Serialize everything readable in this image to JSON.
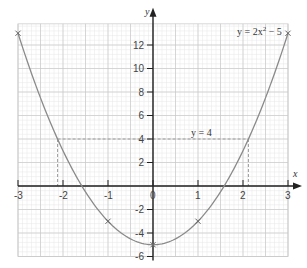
{
  "chart_data": {
    "type": "line",
    "title": "",
    "xlabel": "x",
    "ylabel": "y",
    "xlim": [
      -3,
      3
    ],
    "ylim": [
      -6,
      14
    ],
    "grid": true,
    "x_ticks": [
      -3,
      -2,
      -1,
      0,
      1,
      2,
      3
    ],
    "x_tick_labels": [
      "-3",
      "-2",
      "-1",
      "0",
      "1",
      "2",
      "3"
    ],
    "y_ticks": [
      -6,
      -4,
      -2,
      2,
      4,
      6,
      8,
      10,
      12
    ],
    "y_tick_labels": [
      "-6",
      "-4",
      "-2",
      "2",
      "4",
      "6",
      "8",
      "10",
      "12"
    ],
    "series": [
      {
        "name": "y = 2x² − 5",
        "equation": "y = 2x^2 - 5",
        "marked_points": [
          {
            "x": -3,
            "y": 13
          },
          {
            "x": -1,
            "y": -3
          },
          {
            "x": 0,
            "y": -5
          },
          {
            "x": 1,
            "y": -3
          },
          {
            "x": 3,
            "y": 13
          }
        ]
      }
    ],
    "annotations": [
      {
        "text": "y = 2x² − 5",
        "position": "top-right"
      },
      {
        "text": "y = 4",
        "type": "dashed horizontal line",
        "y": 4,
        "x_range": [
          -2.12,
          2.12
        ]
      },
      {
        "type": "dashed vertical line",
        "x": -2.12,
        "y_range": [
          0,
          4
        ]
      },
      {
        "type": "dashed vertical line",
        "x": 2.12,
        "y_range": [
          0,
          4
        ]
      }
    ]
  },
  "labels": {
    "x_axis": "x",
    "y_axis": "y",
    "curve": "y = 2x",
    "curve_exp": "2",
    "curve_tail": " − 5",
    "hline": "y = 4"
  },
  "colors": {
    "curve": "#8a8a8a",
    "axis": "#222222",
    "grid_major": "#c8c8c8",
    "grid_minor": "#e6e6e6",
    "dashed": "#9a9a9a"
  }
}
